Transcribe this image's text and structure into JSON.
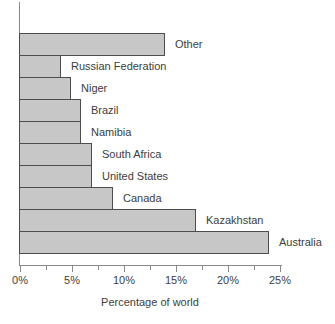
{
  "chart_data": {
    "type": "bar",
    "orientation": "horizontal",
    "categories": [
      "Other",
      "Russian Federation",
      "Niger",
      "Brazil",
      "Namibia",
      "South Africa",
      "United States",
      "Canada",
      "Kazakhstan",
      "Australia"
    ],
    "values": [
      14,
      4,
      5,
      6,
      6,
      7,
      7,
      9,
      17,
      24
    ],
    "title": "",
    "xlabel": "Percentage of world",
    "ylabel": "",
    "xlim": [
      0,
      25
    ],
    "x_ticks": [
      "0%",
      "5%",
      "10%",
      "15%",
      "20%",
      "25%"
    ],
    "x_tick_values": [
      0,
      5,
      10,
      15,
      20,
      25
    ],
    "minor_tick_step": 2.5,
    "grid": false,
    "legend": "none",
    "bar_fill_color": "#c7c7c7",
    "bar_border_color": "#4d4d4d",
    "axis_color": "#8a8a8a",
    "text_color": "#3d3d3d"
  }
}
